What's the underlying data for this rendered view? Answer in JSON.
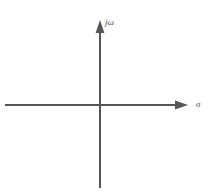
{
  "figure": {
    "name": "complex-s-plane-axes",
    "background_color": "#ffffff",
    "line_color": "#555555",
    "label_color": "#4a4a4a",
    "line_width": 2
  },
  "axes": {
    "imaginary": {
      "label": "jω",
      "icon": "up-arrow-icon",
      "orientation": "vertical",
      "x": 100,
      "y_top": 20,
      "y_bottom": 188,
      "arrow_at": "top"
    },
    "real": {
      "label": "σ",
      "icon": "right-arrow-icon",
      "orientation": "horizontal",
      "y": 105,
      "x_left": 5,
      "x_right": 188,
      "arrow_at": "right"
    }
  },
  "origin": {
    "x": 100,
    "y": 105
  }
}
